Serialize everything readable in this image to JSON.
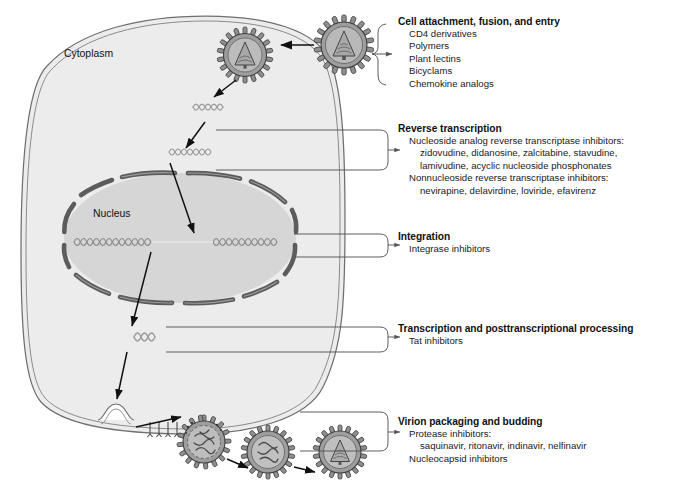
{
  "figure": {
    "type": "hiv-replication-cycle-diagram",
    "cell_labels": [
      {
        "name": "cytoplasm",
        "text": "Cytoplasm",
        "x": 64,
        "y": 48
      },
      {
        "name": "nucleus",
        "text": "Nucleus",
        "x": 93,
        "y": 208
      }
    ]
  },
  "annotations": [
    {
      "id": "attachment",
      "heading": "Cell attachment, fusion, and entry",
      "lines": [
        {
          "text": "CD4 derivatives",
          "indent": 1
        },
        {
          "text": "Polymers",
          "indent": 1
        },
        {
          "text": "Plant lectins",
          "indent": 1
        },
        {
          "text": "Bicyclams",
          "indent": 1
        },
        {
          "text": "Chemokine analogs",
          "indent": 1
        }
      ]
    },
    {
      "id": "reverse-transcription",
      "heading": "Reverse transcription",
      "lines": [
        {
          "text": "Nucleoside analog reverse transcriptase inhibitors:",
          "indent": 1
        },
        {
          "text": "zidovudine, didanosine, zalcitabine, stavudine,",
          "indent": 2
        },
        {
          "text": "lamivudine, acyclic nucleoside phosphonates",
          "indent": 2
        },
        {
          "text": "Nonnucleoside reverse transcriptase inhibitors:",
          "indent": 1
        },
        {
          "text": "nevirapine, delavirdine, loviride, efavirenz",
          "indent": 2
        }
      ]
    },
    {
      "id": "integration",
      "heading": "Integration",
      "lines": [
        {
          "text": "Integrase inhibitors",
          "indent": 1
        }
      ]
    },
    {
      "id": "transcription",
      "heading": "Transcription and posttranscriptional processing",
      "lines": [
        {
          "text": "Tat inhibitors",
          "indent": 1
        }
      ]
    },
    {
      "id": "budding",
      "heading": "Virion packaging and budding",
      "lines": [
        {
          "text": "Protease inhibitors:",
          "indent": 1
        },
        {
          "text": "saquinavir, ritonavir, indinavir, nelfinavir",
          "indent": 2
        },
        {
          "text": "Nucleocapsid inhibitors",
          "indent": 1
        }
      ]
    }
  ],
  "colors": {
    "cell_fill": "#ebebeb",
    "nucleus_fill": "#d4d4d4",
    "membrane_stroke": "#6d6d6d",
    "nuclear_envelope": "#5e5e5e",
    "virion_body": "#9a9a9a",
    "virion_stroke": "#4a4a4a",
    "arrow": "#111111",
    "leader_line": "#555555",
    "nucleic_acid": "#8c8c8c",
    "text": "#111111",
    "background": "#ffffff"
  }
}
